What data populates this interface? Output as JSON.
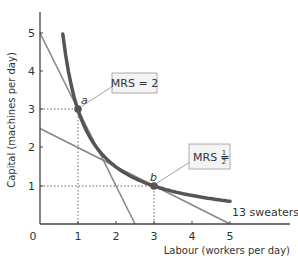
{
  "chart_data": {
    "type": "line",
    "title": "",
    "xlabel": "Labour (workers per day)",
    "ylabel": "Capital (machines per day)",
    "xlim": [
      0,
      5
    ],
    "ylim": [
      0,
      5
    ],
    "x_ticks": [
      "0",
      "1",
      "2",
      "3",
      "4",
      "5"
    ],
    "y_ticks": [
      "1",
      "2",
      "3",
      "4",
      "5"
    ],
    "grid": false,
    "series": [
      {
        "name": "13 sweaters",
        "kind": "isoquant",
        "x": [
          0.6,
          1,
          1.5,
          2,
          2.5,
          3,
          3.5,
          4,
          4.5,
          5
        ],
        "y": [
          5.0,
          3,
          2.0,
          1.5,
          1.2,
          1,
          0.86,
          0.75,
          0.67,
          0.6
        ]
      },
      {
        "name": "tangent at a",
        "kind": "line",
        "x": [
          0,
          2.5
        ],
        "y": [
          5,
          0
        ],
        "slope": -2
      },
      {
        "name": "tangent at b",
        "kind": "line",
        "x": [
          0,
          5
        ],
        "y": [
          2.5,
          0
        ],
        "slope": -0.5
      }
    ],
    "points": [
      {
        "label": "a",
        "x": 1,
        "y": 3
      },
      {
        "label": "b",
        "x": 3,
        "y": 1
      }
    ],
    "annotations": [
      {
        "text": "MRS = 2",
        "point": "a"
      },
      {
        "text": "MRS = 1/2",
        "point": "b"
      }
    ],
    "curve_label": "13 sweaters"
  },
  "labels": {
    "origin": "0",
    "point_a": "a",
    "point_b": "b",
    "mrs_a": "MRS = 2",
    "mrs_b_prefix": "MRS = ",
    "mrs_b_num": "1",
    "mrs_b_den": "2"
  }
}
